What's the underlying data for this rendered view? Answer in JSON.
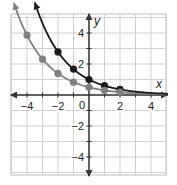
{
  "chart_data": {
    "type": "line",
    "title": "",
    "xlabel": "x",
    "ylabel": "y",
    "xlim": [
      -5,
      5
    ],
    "ylim": [
      -5,
      5
    ],
    "grid": true,
    "x_ticks": [
      -4,
      -2,
      0,
      2,
      4
    ],
    "x_tick_labels": [
      "−4",
      "−2",
      "0",
      "2",
      "4"
    ],
    "y_ticks": [
      4,
      2,
      -2,
      -4
    ],
    "y_tick_labels": [
      "4",
      "2",
      "−2",
      "−4"
    ],
    "legend": null,
    "series": [
      {
        "name": "dark curve",
        "color": "#1a1a1a",
        "x": [
          -2,
          -1,
          0,
          1,
          2
        ],
        "y": [
          2.78,
          1.67,
          1.0,
          0.6,
          0.36
        ]
      },
      {
        "name": "gray curve",
        "color": "#808080",
        "x": [
          -4,
          -3,
          -2,
          -1,
          0,
          1,
          2
        ],
        "y": [
          3.86,
          2.31,
          1.39,
          0.83,
          0.5,
          0.3,
          0.18
        ]
      }
    ]
  },
  "axes": {
    "x_label": "x",
    "y_label": "y",
    "origin_label": "0"
  },
  "colors": {
    "grid": "#cfcfcf",
    "axis": "#333333",
    "frame": "#bdbdbd",
    "dark_series": "#1a1a1a",
    "gray_series": "#808080"
  }
}
